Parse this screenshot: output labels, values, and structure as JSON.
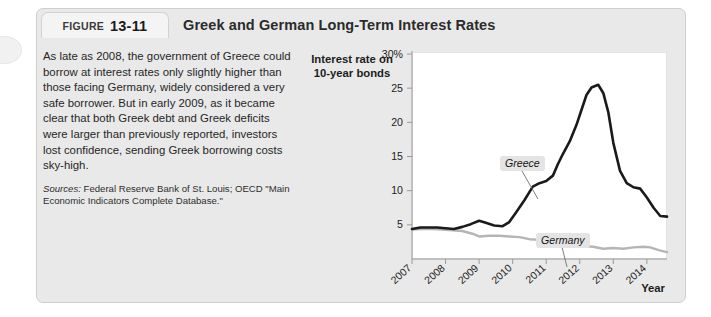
{
  "figure": {
    "tab_word": "FIGURE",
    "tab_number": "13-11",
    "title": "Greek and German Long-Term Interest Rates"
  },
  "text": {
    "paragraph": "As late as 2008, the government of Greece could borrow at interest rates only slightly higher than those facing Germany, widely considered a very safe borrower. But in early 2009, as it became clear that both Greek debt and Greek deficits were larger than previously reported, investors lost confidence, sending Greek borrowing costs sky-high.",
    "sources_label": "Sources:",
    "sources_text": " Federal Reserve Bank of St. Louis; OECD \"Main Economic Indicators Complete Database.\""
  },
  "chart_data": {
    "type": "line",
    "title": "Greek and German Long-Term Interest Rates",
    "ylabel": "Interest rate on 10-year bonds",
    "xlabel": "Year",
    "ylim": [
      0,
      30
    ],
    "xlim": [
      2007,
      2014.6
    ],
    "grid": false,
    "legend_position": "inline-annotation",
    "y_ticks": [
      {
        "value": 30,
        "label": "30%"
      },
      {
        "value": 25,
        "label": "25"
      },
      {
        "value": 20,
        "label": "20"
      },
      {
        "value": 15,
        "label": "15"
      },
      {
        "value": 10,
        "label": "10"
      },
      {
        "value": 5,
        "label": "5"
      }
    ],
    "x_ticks": [
      "2007",
      "2008",
      "2009",
      "2010",
      "2011",
      "2012",
      "2013",
      "2014"
    ],
    "series": [
      {
        "name": "Greece",
        "color": "#1a1a1a",
        "points": [
          [
            2007.0,
            4.4
          ],
          [
            2007.25,
            4.6
          ],
          [
            2007.5,
            4.6
          ],
          [
            2007.75,
            4.6
          ],
          [
            2008.0,
            4.5
          ],
          [
            2008.25,
            4.4
          ],
          [
            2008.5,
            4.7
          ],
          [
            2008.75,
            5.1
          ],
          [
            2009.0,
            5.6
          ],
          [
            2009.2,
            5.3
          ],
          [
            2009.45,
            4.9
          ],
          [
            2009.7,
            4.8
          ],
          [
            2009.9,
            5.4
          ],
          [
            2010.1,
            6.8
          ],
          [
            2010.35,
            8.6
          ],
          [
            2010.6,
            10.6
          ],
          [
            2010.8,
            11.1
          ],
          [
            2011.0,
            11.4
          ],
          [
            2011.2,
            12.2
          ],
          [
            2011.35,
            13.9
          ],
          [
            2011.5,
            15.4
          ],
          [
            2011.7,
            17.2
          ],
          [
            2011.9,
            19.6
          ],
          [
            2012.05,
            21.8
          ],
          [
            2012.2,
            24.0
          ],
          [
            2012.35,
            25.1
          ],
          [
            2012.55,
            25.5
          ],
          [
            2012.7,
            24.3
          ],
          [
            2012.85,
            21.5
          ],
          [
            2013.0,
            17.0
          ],
          [
            2013.2,
            12.9
          ],
          [
            2013.4,
            11.1
          ],
          [
            2013.6,
            10.5
          ],
          [
            2013.8,
            10.3
          ],
          [
            2014.0,
            9.0
          ],
          [
            2014.2,
            7.5
          ],
          [
            2014.4,
            6.3
          ],
          [
            2014.6,
            6.2
          ]
        ]
      },
      {
        "name": "Germany",
        "color": "#b5b5b5",
        "points": [
          [
            2007.0,
            4.3
          ],
          [
            2007.3,
            4.4
          ],
          [
            2007.6,
            4.4
          ],
          [
            2007.9,
            4.3
          ],
          [
            2008.2,
            4.2
          ],
          [
            2008.5,
            4.1
          ],
          [
            2008.8,
            3.7
          ],
          [
            2009.0,
            3.3
          ],
          [
            2009.3,
            3.4
          ],
          [
            2009.6,
            3.4
          ],
          [
            2009.9,
            3.3
          ],
          [
            2010.2,
            3.2
          ],
          [
            2010.5,
            2.9
          ],
          [
            2010.8,
            2.8
          ],
          [
            2011.0,
            3.1
          ],
          [
            2011.25,
            3.3
          ],
          [
            2011.45,
            3.2
          ],
          [
            2011.65,
            2.8
          ],
          [
            2011.85,
            2.2
          ],
          [
            2012.1,
            1.9
          ],
          [
            2012.4,
            1.8
          ],
          [
            2012.7,
            1.5
          ],
          [
            2013.0,
            1.6
          ],
          [
            2013.3,
            1.5
          ],
          [
            2013.6,
            1.7
          ],
          [
            2013.9,
            1.8
          ],
          [
            2014.1,
            1.7
          ],
          [
            2014.35,
            1.3
          ],
          [
            2014.6,
            1.0
          ]
        ]
      }
    ],
    "annotations": [
      {
        "text": "Greece",
        "target_series": "Greece"
      },
      {
        "text": "Germany",
        "target_series": "Germany"
      }
    ]
  }
}
